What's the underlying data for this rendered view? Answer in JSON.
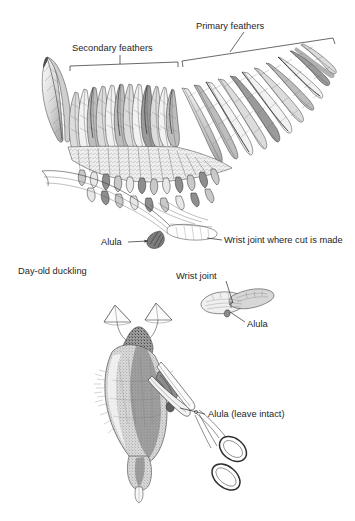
{
  "figure": {
    "kind": "anatomical-line-drawing",
    "background_color": "#ffffff",
    "ink_color": "#2f2f2f",
    "panels": [
      {
        "id": "wing-panel",
        "name": "outstretched-wing",
        "caption": ""
      },
      {
        "id": "duckling-panel",
        "name": "day-old-duckling",
        "caption": ""
      },
      {
        "id": "folded-wing-inset",
        "name": "folded-wing-detail",
        "caption": ""
      }
    ]
  },
  "labels": {
    "primary_feathers": "Primary feathers",
    "secondary_feathers": "Secondary feathers",
    "alula_wing": "Alula",
    "wrist_joint_cut": "Wrist joint where cut is made",
    "day_old_duckling": "Day-old duckling",
    "wrist_joint_inset": "Wrist joint",
    "alula_inset": "Alula",
    "alula_leave_intact": "Alula (leave intact)"
  },
  "annotations": {
    "leaders": [
      {
        "name": "primary-feathers-leader",
        "from": "Primary feathers",
        "to": "primary feather bracket"
      },
      {
        "name": "secondary-feathers-leader",
        "from": "Secondary feathers",
        "to": "secondary feather bracket"
      },
      {
        "name": "alula-arrow",
        "from": "Alula",
        "to": "alula at wing base"
      },
      {
        "name": "wrist-joint-leader",
        "from": "Wrist joint where cut is made",
        "to": "carpal joint"
      },
      {
        "name": "wrist-joint-inset-leader",
        "from": "Wrist joint",
        "to": "carpal joint on folded wing"
      },
      {
        "name": "alula-inset-leader",
        "from": "Alula",
        "to": "alula on folded wing"
      },
      {
        "name": "alula-intact-leader",
        "from": "Alula (leave intact)",
        "to": "alula on duckling wing"
      }
    ],
    "brackets": [
      {
        "name": "primary-feathers-bracket",
        "spans": "Primary feathers"
      },
      {
        "name": "secondary-feathers-bracket",
        "spans": "Secondary feathers"
      }
    ]
  },
  "objects": {
    "scissors": "surgical scissors positioned at the wrist joint",
    "duckling": "day-old duckling held ventral side up",
    "webbed_feet": "two webbed feet",
    "folded_wing": "folded wing detail sketch"
  }
}
